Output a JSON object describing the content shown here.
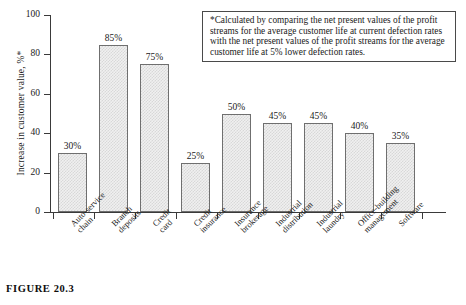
{
  "chart_data": {
    "type": "bar",
    "title": "",
    "xlabel": "",
    "ylabel": "Increase in customer value, %*",
    "ylim": [
      0,
      100
    ],
    "yticks": [
      0,
      20,
      40,
      60,
      80,
      100
    ],
    "grid": false,
    "legend": "none",
    "categories": [
      "Auto-service chain",
      "Branch deposits",
      "Credit card",
      "Credit insurance",
      "Insurance brokerage",
      "Industrial distribution",
      "Industrial laundry",
      "Office-building management",
      "Software"
    ],
    "category_lines": [
      [
        "Auto-service",
        "chain"
      ],
      [
        "Branch",
        "deposits"
      ],
      [
        "Credit",
        "card"
      ],
      [
        "Credit",
        "insurance"
      ],
      [
        "Insurance",
        "brokerage"
      ],
      [
        "Industrial",
        "distribution"
      ],
      [
        "Industrial",
        "laundry"
      ],
      [
        "Office-building",
        "management"
      ],
      [
        "Software"
      ]
    ],
    "values": [
      30,
      85,
      75,
      25,
      50,
      45,
      45,
      40,
      35
    ],
    "value_labels": [
      "30%",
      "85%",
      "75%",
      "25%",
      "50%",
      "45%",
      "45%",
      "40%",
      "35%"
    ],
    "bar_fill_color": "#f0f0f0",
    "bar_pattern": "stipple-checker",
    "bar_edge_color": "#6f6f6f"
  },
  "annotation": {
    "box_text": "*Calculated by comparing the net present values of the profit streams for the average customer life at current defection rates with the net present values of the profit streams for the average customer life at 5% lower defection rates."
  },
  "caption": {
    "figure_number": "FIGURE 20.3",
    "subtitle": ""
  }
}
